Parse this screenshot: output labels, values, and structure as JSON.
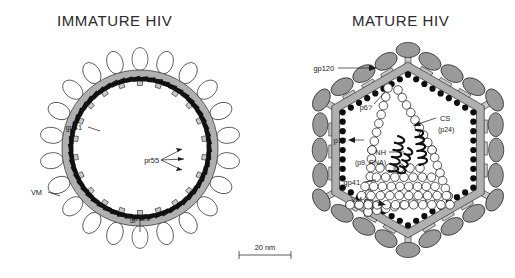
{
  "figure": {
    "scale_bar": {
      "label": "20 nm"
    }
  },
  "panels": [
    {
      "id": "immature",
      "title": "IMMATURE HIV",
      "shape": "circle",
      "labels": [
        {
          "name": "gp41",
          "text": "gp41"
        },
        {
          "name": "pr55",
          "text": "pr55"
        },
        {
          "name": "vm",
          "text": "VM"
        },
        {
          "name": "gp120",
          "text": "gp120"
        }
      ]
    },
    {
      "id": "mature",
      "title": "MATURE HIV",
      "shape": "hexagon",
      "labels": [
        {
          "name": "gp120",
          "text": "gp120"
        },
        {
          "name": "p6",
          "text": "p6?"
        },
        {
          "name": "cs",
          "text": "CS"
        },
        {
          "name": "cs-sub",
          "text": "(p24)"
        },
        {
          "name": "p17",
          "text": "p17"
        },
        {
          "name": "nh",
          "text": "NH"
        },
        {
          "name": "nh-sub",
          "text": "(p9, RNA)"
        },
        {
          "name": "gp41",
          "text": "gp41"
        },
        {
          "name": "vm",
          "text": "VM"
        }
      ]
    }
  ],
  "colors": {
    "membrane": "#b0b0b0",
    "spike_immature": "#ffffff",
    "spike_mature": "#9a9a9a",
    "matrix_dot": "#0d0d0d",
    "gag_rod": "#111111",
    "capsid": "#ffffff",
    "ink": "#1a1a1a"
  }
}
